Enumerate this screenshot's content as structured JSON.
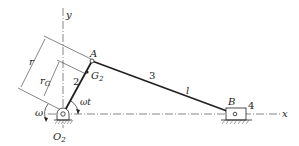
{
  "diagram": {
    "axes": {
      "x_label": "x",
      "y_label": "y"
    },
    "points": {
      "O2": {
        "label": "O",
        "sub": "2"
      },
      "A": {
        "label": "A"
      },
      "B": {
        "label": "B"
      },
      "G2": {
        "label": "G",
        "sub": "2"
      }
    },
    "links": {
      "crank": "2",
      "coupler": "3",
      "slider": "4"
    },
    "dimensions": {
      "r": "r",
      "rG": "r",
      "rG_sub": "G",
      "l": "l"
    },
    "angle": {
      "label": "ωt"
    },
    "angular_velocity": {
      "label": "ω"
    },
    "colors": {
      "ink": "#222222",
      "background": "#ffffff"
    }
  }
}
